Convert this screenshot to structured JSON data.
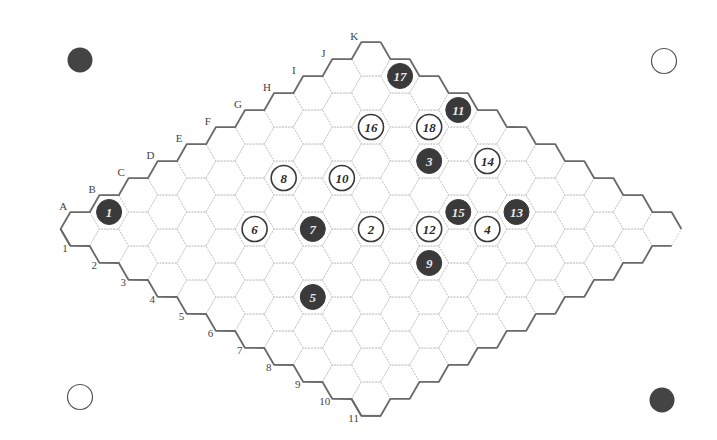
{
  "board": {
    "size": 11,
    "letters": [
      "A",
      "B",
      "C",
      "D",
      "E",
      "F",
      "G",
      "H",
      "I",
      "J",
      "K"
    ],
    "numbers": [
      "1",
      "2",
      "3",
      "4",
      "5",
      "6",
      "7",
      "8",
      "9",
      "10",
      "11"
    ],
    "colors": {
      "black": "#3a3a3a",
      "white": "#ffffff",
      "grid": "#b8b8b8",
      "border": "#6a6a6a"
    }
  },
  "corners": [
    {
      "position": "top-left",
      "color": "black"
    },
    {
      "position": "top-right",
      "color": "white"
    },
    {
      "position": "bottom-left",
      "color": "white"
    },
    {
      "position": "bottom-right",
      "color": "black"
    }
  ],
  "moves": [
    {
      "n": "1",
      "color": "black",
      "cell": "B1"
    },
    {
      "n": "2",
      "color": "white",
      "cell": "F6"
    },
    {
      "n": "3",
      "color": "black",
      "cell": "I5"
    },
    {
      "n": "4",
      "color": "white",
      "cell": "H8"
    },
    {
      "n": "5",
      "color": "black",
      "cell": "C7"
    },
    {
      "n": "6",
      "color": "white",
      "cell": "D4"
    },
    {
      "n": "7",
      "color": "black",
      "cell": "E5"
    },
    {
      "n": "8",
      "color": "white",
      "cell": "F3"
    },
    {
      "n": "9",
      "color": "black",
      "cell": "F8"
    },
    {
      "n": "10",
      "color": "white",
      "cell": "G4"
    },
    {
      "n": "11",
      "color": "black",
      "cell": "K4"
    },
    {
      "n": "12",
      "color": "white",
      "cell": "G7"
    },
    {
      "n": "13",
      "color": "black",
      "cell": "I8"
    },
    {
      "n": "14",
      "color": "white",
      "cell": "J6"
    },
    {
      "n": "15",
      "color": "black",
      "cell": "H7"
    },
    {
      "n": "16",
      "color": "white",
      "cell": "I3"
    },
    {
      "n": "17",
      "color": "black",
      "cell": "K2"
    },
    {
      "n": "18",
      "color": "white",
      "cell": "J4"
    }
  ]
}
